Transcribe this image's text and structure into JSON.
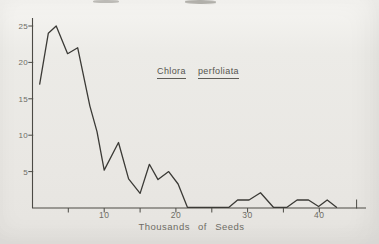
{
  "figure": {
    "title": {
      "genus": "Chlora",
      "species": "perfoliata"
    },
    "x_axis_title": "Thousands of Seeds"
  },
  "colors": {
    "paper": "#e9e7e3",
    "line": "#3b3a36",
    "axis": "#4c4a45",
    "tick_label": "#6e6c65",
    "title_text": "#56544e"
  },
  "chart_data": {
    "type": "line",
    "title": "Chlora perfoliata",
    "xlabel": "Thousands of Seeds",
    "ylabel": "",
    "xlim": [
      0,
      46
    ],
    "ylim": [
      0,
      26
    ],
    "grid": false,
    "legend": "none",
    "x_ticks": [
      5,
      10,
      15,
      20,
      25,
      30,
      35,
      40
    ],
    "x_end_tick": 45,
    "x_tick_labels": [
      {
        "value": 10,
        "label": "10"
      },
      {
        "value": 20,
        "label": "20"
      },
      {
        "value": 30,
        "label": "30"
      },
      {
        "value": 40,
        "label": "40"
      }
    ],
    "y_tick_labels": [
      {
        "value": 5,
        "label": "5"
      },
      {
        "value": 10,
        "label": "10"
      },
      {
        "value": 15,
        "label": "15"
      },
      {
        "value": 20,
        "label": "20"
      },
      {
        "value": 25,
        "label": "25"
      }
    ],
    "series": [
      {
        "name": "Chlora perfoliata",
        "points": [
          [
            1,
            17
          ],
          [
            2.2,
            24
          ],
          [
            3.3,
            25
          ],
          [
            4.9,
            21.2
          ],
          [
            6.3,
            22
          ],
          [
            8,
            14
          ],
          [
            9,
            10.5
          ],
          [
            10,
            5.2
          ],
          [
            12,
            9
          ],
          [
            13.4,
            4
          ],
          [
            15,
            2
          ],
          [
            16.3,
            6
          ],
          [
            17.5,
            3.9
          ],
          [
            19,
            5
          ],
          [
            20.3,
            3.3
          ],
          [
            21.6,
            0.1
          ],
          [
            27.4,
            0.1
          ],
          [
            28.6,
            1.1
          ],
          [
            30.2,
            1.1
          ],
          [
            31.8,
            2.1
          ],
          [
            33.6,
            0.1
          ],
          [
            35.5,
            0.1
          ],
          [
            36.9,
            1.1
          ],
          [
            38.5,
            1.1
          ],
          [
            39.9,
            0.2
          ],
          [
            41.1,
            1.1
          ],
          [
            42.4,
            0.1
          ]
        ]
      }
    ]
  }
}
